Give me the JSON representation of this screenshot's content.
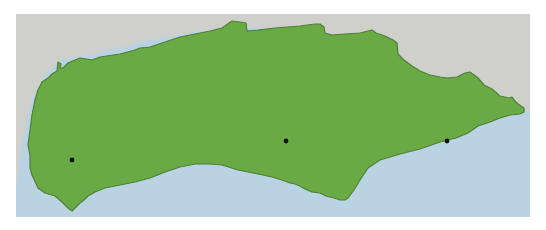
{
  "map": {
    "colors": {
      "page_background": "#ffffff",
      "neighbor_land": "#cfd0cc",
      "sea": "#b9d3e3",
      "region_fill": "#6aaa45",
      "region_border": "#4f7f36",
      "marker": "#111111"
    },
    "markers": [
      {
        "id": "marker-west",
        "x": 72,
        "y": 160
      },
      {
        "id": "marker-center",
        "x": 286,
        "y": 141
      },
      {
        "id": "marker-east",
        "x": 447,
        "y": 141
      }
    ]
  }
}
